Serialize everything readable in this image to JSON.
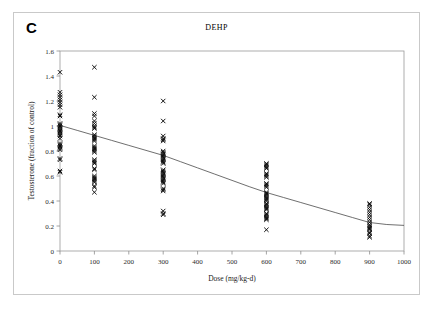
{
  "figure": {
    "panel_label": "C",
    "border_color": "#c9c9c9",
    "background": "#ffffff"
  },
  "chart_data": {
    "type": "scatter",
    "title": "DEHP",
    "xlabel": "Dose (mg/kg-d)",
    "ylabel": "Testosterone (fraction of control)",
    "xlim": [
      0,
      1000
    ],
    "ylim": [
      0,
      1.6
    ],
    "xticks": [
      0,
      100,
      200,
      300,
      400,
      500,
      600,
      700,
      800,
      900,
      1000
    ],
    "xtick_labels": [
      "0",
      "100",
      "200",
      "300",
      "400",
      "500",
      "600",
      "700",
      "800",
      "900",
      "1000"
    ],
    "yticks": [
      0,
      0.2,
      0.4,
      0.6,
      0.8,
      1,
      1.2,
      1.4,
      1.6
    ],
    "ytick_labels": [
      "0",
      "0.2",
      "0.4",
      "0.6",
      "0.8",
      "1",
      "1.2",
      "1.4",
      "1.6"
    ],
    "grid": false,
    "legend": null,
    "marker": "x",
    "marker_color": "#0a0a0a",
    "series": [
      {
        "name": "Testosterone observations",
        "type": "scatter",
        "points": [
          [
            0,
            1.43
          ],
          [
            0,
            1.27
          ],
          [
            0,
            1.25
          ],
          [
            0,
            1.23
          ],
          [
            0,
            1.21
          ],
          [
            0,
            1.19
          ],
          [
            0,
            1.17
          ],
          [
            0,
            1.15
          ],
          [
            0,
            1.09
          ],
          [
            0,
            1.08
          ],
          [
            0,
            1.02
          ],
          [
            0,
            1.01
          ],
          [
            0,
            1.0
          ],
          [
            0,
            0.99
          ],
          [
            0,
            0.98
          ],
          [
            0,
            0.97
          ],
          [
            0,
            0.96
          ],
          [
            0,
            0.95
          ],
          [
            0,
            0.94
          ],
          [
            0,
            0.93
          ],
          [
            0,
            0.92
          ],
          [
            0,
            0.9
          ],
          [
            0,
            0.86
          ],
          [
            0,
            0.85
          ],
          [
            0,
            0.84
          ],
          [
            0,
            0.83
          ],
          [
            0,
            0.82
          ],
          [
            0,
            0.81
          ],
          [
            0,
            0.74
          ],
          [
            0,
            0.73
          ],
          [
            0,
            0.64
          ],
          [
            0,
            0.63
          ],
          [
            100,
            1.47
          ],
          [
            100,
            1.23
          ],
          [
            100,
            1.1
          ],
          [
            100,
            1.08
          ],
          [
            100,
            1.04
          ],
          [
            100,
            1.02
          ],
          [
            100,
            1.0
          ],
          [
            100,
            0.99
          ],
          [
            100,
            0.98
          ],
          [
            100,
            0.93
          ],
          [
            100,
            0.92
          ],
          [
            100,
            0.91
          ],
          [
            100,
            0.9
          ],
          [
            100,
            0.89
          ],
          [
            100,
            0.88
          ],
          [
            100,
            0.84
          ],
          [
            100,
            0.83
          ],
          [
            100,
            0.82
          ],
          [
            100,
            0.81
          ],
          [
            100,
            0.8
          ],
          [
            100,
            0.79
          ],
          [
            100,
            0.73
          ],
          [
            100,
            0.72
          ],
          [
            100,
            0.71
          ],
          [
            100,
            0.7
          ],
          [
            100,
            0.66
          ],
          [
            100,
            0.65
          ],
          [
            100,
            0.6
          ],
          [
            100,
            0.59
          ],
          [
            100,
            0.58
          ],
          [
            100,
            0.57
          ],
          [
            100,
            0.56
          ],
          [
            100,
            0.55
          ],
          [
            100,
            0.52
          ],
          [
            100,
            0.51
          ],
          [
            100,
            0.47
          ],
          [
            300,
            1.2
          ],
          [
            300,
            1.04
          ],
          [
            300,
            0.92
          ],
          [
            300,
            0.9
          ],
          [
            300,
            0.89
          ],
          [
            300,
            0.88
          ],
          [
            300,
            0.8
          ],
          [
            300,
            0.79
          ],
          [
            300,
            0.78
          ],
          [
            300,
            0.77
          ],
          [
            300,
            0.76
          ],
          [
            300,
            0.75
          ],
          [
            300,
            0.74
          ],
          [
            300,
            0.73
          ],
          [
            300,
            0.72
          ],
          [
            300,
            0.71
          ],
          [
            300,
            0.7
          ],
          [
            300,
            0.65
          ],
          [
            300,
            0.64
          ],
          [
            300,
            0.63
          ],
          [
            300,
            0.62
          ],
          [
            300,
            0.61
          ],
          [
            300,
            0.6
          ],
          [
            300,
            0.59
          ],
          [
            300,
            0.58
          ],
          [
            300,
            0.57
          ],
          [
            300,
            0.56
          ],
          [
            300,
            0.55
          ],
          [
            300,
            0.54
          ],
          [
            300,
            0.5
          ],
          [
            300,
            0.49
          ],
          [
            300,
            0.48
          ],
          [
            300,
            0.32
          ],
          [
            300,
            0.3
          ],
          [
            300,
            0.29
          ],
          [
            600,
            0.7
          ],
          [
            600,
            0.69
          ],
          [
            600,
            0.68
          ],
          [
            600,
            0.67
          ],
          [
            600,
            0.66
          ],
          [
            600,
            0.62
          ],
          [
            600,
            0.61
          ],
          [
            600,
            0.6
          ],
          [
            600,
            0.59
          ],
          [
            600,
            0.54
          ],
          [
            600,
            0.53
          ],
          [
            600,
            0.52
          ],
          [
            600,
            0.51
          ],
          [
            600,
            0.47
          ],
          [
            600,
            0.46
          ],
          [
            600,
            0.45
          ],
          [
            600,
            0.44
          ],
          [
            600,
            0.43
          ],
          [
            600,
            0.42
          ],
          [
            600,
            0.41
          ],
          [
            600,
            0.4
          ],
          [
            600,
            0.38
          ],
          [
            600,
            0.37
          ],
          [
            600,
            0.36
          ],
          [
            600,
            0.35
          ],
          [
            600,
            0.34
          ],
          [
            600,
            0.33
          ],
          [
            600,
            0.3
          ],
          [
            600,
            0.29
          ],
          [
            600,
            0.28
          ],
          [
            600,
            0.27
          ],
          [
            600,
            0.26
          ],
          [
            600,
            0.25
          ],
          [
            600,
            0.17
          ],
          [
            900,
            0.38
          ],
          [
            900,
            0.37
          ],
          [
            900,
            0.35
          ],
          [
            900,
            0.33
          ],
          [
            900,
            0.31
          ],
          [
            900,
            0.29
          ],
          [
            900,
            0.27
          ],
          [
            900,
            0.25
          ],
          [
            900,
            0.23
          ],
          [
            900,
            0.21
          ],
          [
            900,
            0.2
          ],
          [
            900,
            0.19
          ],
          [
            900,
            0.18
          ],
          [
            900,
            0.17
          ],
          [
            900,
            0.15
          ],
          [
            900,
            0.14
          ],
          [
            900,
            0.12
          ],
          [
            900,
            0.11
          ]
        ]
      },
      {
        "name": "Fitted dose-response curve",
        "type": "line",
        "color": "#4a4a4a",
        "points": [
          [
            0,
            1.005
          ],
          [
            50,
            0.965
          ],
          [
            100,
            0.925
          ],
          [
            150,
            0.885
          ],
          [
            200,
            0.845
          ],
          [
            250,
            0.805
          ],
          [
            300,
            0.765
          ],
          [
            350,
            0.715
          ],
          [
            400,
            0.665
          ],
          [
            450,
            0.615
          ],
          [
            500,
            0.565
          ],
          [
            550,
            0.515
          ],
          [
            600,
            0.468
          ],
          [
            650,
            0.428
          ],
          [
            700,
            0.388
          ],
          [
            750,
            0.348
          ],
          [
            800,
            0.308
          ],
          [
            850,
            0.268
          ],
          [
            900,
            0.228
          ],
          [
            950,
            0.212
          ],
          [
            1000,
            0.205
          ]
        ]
      }
    ]
  }
}
